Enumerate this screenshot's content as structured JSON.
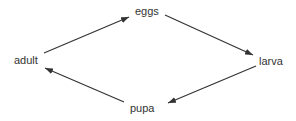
{
  "diagram": {
    "nodes": [
      {
        "id": "eggs",
        "label": "eggs"
      },
      {
        "id": "larva",
        "label": "larva"
      },
      {
        "id": "pupa",
        "label": "pupa"
      },
      {
        "id": "adult",
        "label": "adult"
      }
    ],
    "edges": [
      {
        "from": "adult",
        "to": "eggs"
      },
      {
        "from": "eggs",
        "to": "larva"
      },
      {
        "from": "larva",
        "to": "pupa"
      },
      {
        "from": "pupa",
        "to": "adult"
      }
    ],
    "colors": {
      "arrow": "#333333",
      "text": "#333333"
    }
  }
}
